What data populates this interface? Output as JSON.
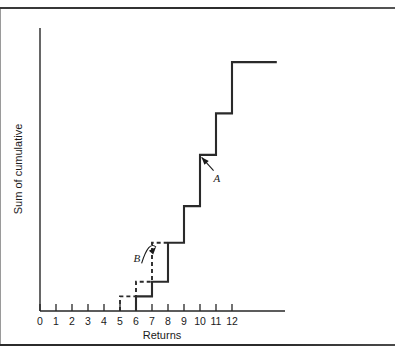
{
  "page": {
    "background_color": "#ffffff",
    "ink_color": "#2a2a2a",
    "top_rule": "horizontal-rule",
    "bottom_rule": "horizontal-rule",
    "left_rule": "vertical-rule"
  },
  "chart_data": {
    "type": "line",
    "subtype": "cumulative-step-ogive",
    "title": "",
    "xlabel": "Returns",
    "ylabel": "Sum of cumulative",
    "grid": false,
    "legend": "none",
    "xlim": [
      0,
      15
    ],
    "ylim": [
      0,
      11
    ],
    "x_ticks": [
      0,
      1,
      2,
      3,
      4,
      5,
      6,
      7,
      8,
      9,
      10,
      11,
      12
    ],
    "x_tick_labels": [
      "0",
      "1",
      "2",
      "3",
      "4",
      "5",
      "6",
      "7",
      "8",
      "9",
      "10",
      "11",
      "12"
    ],
    "y_ticks": [],
    "y_tick_labels": [],
    "series": [
      {
        "name": "A",
        "style": "solid",
        "label": "A",
        "annotation": "A",
        "step_x": [
          6,
          7,
          8,
          9,
          10,
          11,
          12,
          14.8
        ],
        "step_y": [
          0,
          0.6,
          1.2,
          2.8,
          4.3,
          6.4,
          8.1,
          10.2
        ],
        "points": [
          {
            "x": 6,
            "y": 0
          },
          {
            "x": 6,
            "y": 0.6
          },
          {
            "x": 7,
            "y": 0.6
          },
          {
            "x": 7,
            "y": 1.2
          },
          {
            "x": 8,
            "y": 1.2
          },
          {
            "x": 8,
            "y": 2.8
          },
          {
            "x": 9,
            "y": 2.8
          },
          {
            "x": 9,
            "y": 4.3
          },
          {
            "x": 10,
            "y": 4.3
          },
          {
            "x": 10,
            "y": 6.4
          },
          {
            "x": 11,
            "y": 6.4
          },
          {
            "x": 11,
            "y": 8.1
          },
          {
            "x": 12,
            "y": 8.1
          },
          {
            "x": 12,
            "y": 10.2
          },
          {
            "x": 14.8,
            "y": 10.2
          }
        ]
      },
      {
        "name": "B",
        "style": "dashed",
        "label": "B",
        "annotation": "B",
        "step_x": [
          5,
          6,
          7,
          8
        ],
        "step_y": [
          0,
          0.6,
          1.2,
          2.8
        ],
        "points": [
          {
            "x": 5,
            "y": 0
          },
          {
            "x": 5,
            "y": 0.6
          },
          {
            "x": 6,
            "y": 0.6
          },
          {
            "x": 6,
            "y": 1.2
          },
          {
            "x": 7,
            "y": 1.2
          },
          {
            "x": 7,
            "y": 2.8
          },
          {
            "x": 7.95,
            "y": 2.8
          }
        ]
      }
    ],
    "annotations": [
      {
        "text": "A",
        "target_series": "A",
        "label_x": 11.05,
        "label_y": 5.3,
        "arrow_from_x": 10.85,
        "arrow_from_y": 5.75,
        "arrow_to_x": 10.1,
        "arrow_to_y": 6.3,
        "arrow_style": "straight",
        "points_to": "step-corner-at-x-10"
      },
      {
        "text": "B",
        "target_series": "B",
        "label_x": 6.05,
        "label_y": 2.0,
        "arrow_from_x": 6.35,
        "arrow_from_y": 1.95,
        "arrow_to_x": 7.25,
        "arrow_to_y": 2.62,
        "arrow_style": "curved",
        "points_to": "dashed-plateau-at-x-7"
      }
    ]
  }
}
